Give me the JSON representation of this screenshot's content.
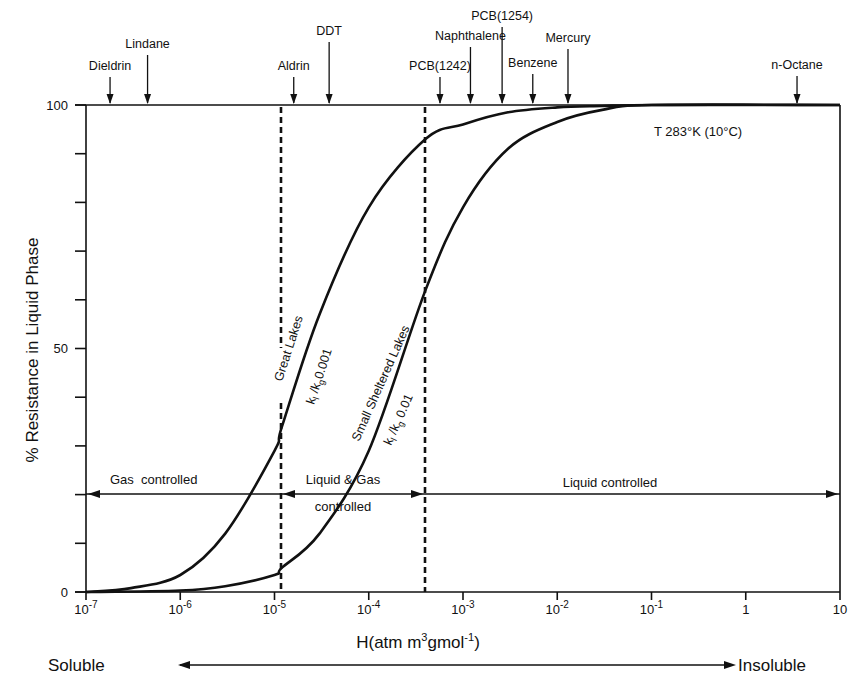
{
  "chart_data": {
    "type": "line",
    "title": "",
    "xlabel": "H(atm m³gmol⁻¹)",
    "ylabel": "% Resistance in Liquid Phase",
    "xscale": "log",
    "xlim": [
      1e-07,
      10
    ],
    "ylim": [
      0,
      100
    ],
    "x_tick_labels": [
      "10⁻⁷",
      "10⁻⁶",
      "10⁻⁵",
      "10⁻⁴",
      "10⁻³",
      "10⁻²",
      "10⁻¹",
      "1",
      "10"
    ],
    "x_tick_values": [
      1e-07,
      1e-06,
      1e-05,
      0.0001,
      0.001,
      0.01,
      0.1,
      1,
      10
    ],
    "y_tick_labels": [
      "0",
      "50",
      "100"
    ],
    "y_minor_tick_step": 10,
    "grid": false,
    "series": [
      {
        "name": "Great Lakes k_l/k_g 0.001",
        "x": [
          1e-07,
          3e-07,
          1e-06,
          3e-06,
          1e-05,
          1.2e-05,
          3e-05,
          0.0001,
          0.0004,
          0.001,
          0.003,
          0.01,
          0.03,
          0.1,
          10
        ],
        "y": [
          0,
          0.8,
          3.5,
          12,
          29,
          34,
          57,
          79,
          93,
          96,
          98.5,
          99.5,
          99.8,
          100,
          100
        ]
      },
      {
        "name": "Small Sheltered Lakes k_l/k_g 0.01",
        "x": [
          1e-07,
          1e-06,
          3e-06,
          1e-05,
          1.2e-05,
          3e-05,
          0.0001,
          0.0004,
          0.001,
          0.003,
          0.01,
          0.03,
          0.1,
          10
        ],
        "y": [
          0,
          0.3,
          1.2,
          3.5,
          5,
          12,
          29,
          62,
          79,
          91,
          96.5,
          99,
          100,
          100
        ]
      }
    ],
    "vertical_dashed_lines": [
      1.2e-05,
      0.0004
    ],
    "regions": [
      {
        "label": "Gas controlled",
        "from": 1e-07,
        "to": 1.2e-05
      },
      {
        "label": "Liquid & Gas controlled",
        "from": 1.2e-05,
        "to": 0.0004
      },
      {
        "label": "Liquid controlled",
        "from": 0.0004,
        "to": 10
      }
    ],
    "compounds": [
      {
        "name": "Dieldrin",
        "H": 1.8e-07
      },
      {
        "name": "Lindane",
        "H": 4.5e-07
      },
      {
        "name": "Aldrin",
        "H": 1.6e-05
      },
      {
        "name": "DDT",
        "H": 3.8e-05
      },
      {
        "name": "PCB(1242)",
        "H": 0.00057
      },
      {
        "name": "Naphthalene",
        "H": 0.0012
      },
      {
        "name": "PCB(1254)",
        "H": 0.0026
      },
      {
        "name": "Benzene",
        "H": 0.0055
      },
      {
        "name": "Mercury",
        "H": 0.013
      },
      {
        "name": "n-Octane",
        "H": 3.5
      }
    ],
    "annotations": [
      "T 283°K (10°C)",
      "Great Lakes",
      "k_l/k_g 0.001",
      "Small Sheltered Lakes",
      "k_l/k_g 0.01"
    ]
  },
  "labels": {
    "y_axis_title": "% Resistance in Liquid Phase",
    "x_axis_title_prefix": "H(atm m",
    "x_axis_title_mid": "gmol",
    "x_axis_title_sup1": "3",
    "x_axis_title_sup2": "-1",
    "x_axis_title_suffix": ")",
    "y_0": "0",
    "y_50": "50",
    "y_100": "100",
    "temperature": "T 283°K (10°C)",
    "gas_controlled": "Gas  controlled",
    "liquid_gas_1": "Liquid & Gas",
    "liquid_gas_2": "controlled",
    "liquid_controlled": "Liquid controlled",
    "great_lakes": "Great Lakes",
    "gl_ratio_k": "k",
    "gl_ratio_sub1": "l",
    "gl_ratio_mid": " /k",
    "gl_ratio_sub2": "g",
    "gl_ratio_val": "0.001",
    "small_lakes": "Small Sheltered Lakes",
    "sl_ratio_val": " 0.01",
    "soluble": "Soluble",
    "insoluble": "Insoluble"
  }
}
